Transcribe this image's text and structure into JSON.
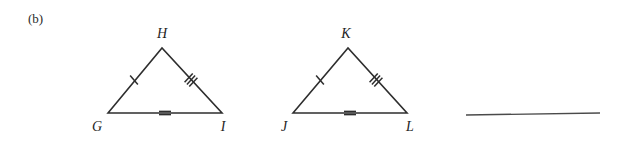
{
  "figure": {
    "part_label": "(b)",
    "background_color": "#ffffff",
    "stroke_color": "#2e2e2e",
    "rule_color": "#4a4a4a",
    "width": 626,
    "height": 151
  },
  "triangles": [
    {
      "name": "triangle-GHI",
      "vertices": [
        {
          "label": "G",
          "x": 108,
          "y": 113,
          "label_x": 97,
          "label_y": 131
        },
        {
          "label": "H",
          "x": 162,
          "y": 48,
          "label_x": 162,
          "label_y": 38
        },
        {
          "label": "I",
          "x": 222,
          "y": 113,
          "label_x": 223,
          "label_y": 131
        }
      ],
      "sides": [
        {
          "name": "side-GH",
          "from": "G",
          "to": "H",
          "ticks": 1,
          "tick_x": 134,
          "tick_y": 80,
          "tick_angle": 50
        },
        {
          "name": "side-HI",
          "from": "H",
          "to": "I",
          "ticks": 3,
          "tick_x": 191,
          "tick_y": 80,
          "tick_angle": -47
        },
        {
          "name": "side-GI",
          "from": "G",
          "to": "I",
          "ticks": 2,
          "tick_x": 165,
          "tick_y": 113,
          "tick_angle": 0
        }
      ]
    },
    {
      "name": "triangle-JKL",
      "vertices": [
        {
          "label": "J",
          "x": 293,
          "y": 113,
          "label_x": 284,
          "label_y": 131
        },
        {
          "label": "K",
          "x": 348,
          "y": 48,
          "label_x": 346,
          "label_y": 38
        },
        {
          "label": "L",
          "x": 407,
          "y": 113,
          "label_x": 410,
          "label_y": 131
        }
      ],
      "sides": [
        {
          "name": "side-JK",
          "from": "J",
          "to": "K",
          "ticks": 1,
          "tick_x": 320,
          "tick_y": 80,
          "tick_angle": 50
        },
        {
          "name": "side-KL",
          "from": "K",
          "to": "L",
          "ticks": 3,
          "tick_x": 376,
          "tick_y": 80,
          "tick_angle": -47
        },
        {
          "name": "side-JL",
          "from": "J",
          "to": "L",
          "ticks": 2,
          "tick_x": 350,
          "tick_y": 113,
          "tick_angle": 0
        }
      ]
    }
  ],
  "answer_rule": {
    "name": "answer-blank-line",
    "x1": 466,
    "y1": 115,
    "x2": 600,
    "y2": 113
  }
}
